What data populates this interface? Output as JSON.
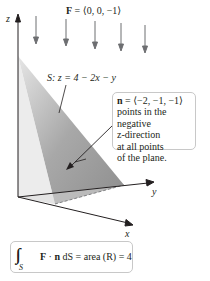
{
  "field": {
    "label_bold": "F",
    "label_rest": " = ⟨0, 0, −1⟩",
    "arrow_color": "#6d6e71",
    "arrow_count": 5
  },
  "axes": {
    "z_label": "z",
    "y_label": "y",
    "x_label": "x",
    "color": "#231f20"
  },
  "surface": {
    "label_prefix": "S",
    "label_eq": ": z = 4 − 2x − y",
    "fill_light": "#d9d9d9",
    "fill_dark": "#9a9a9a"
  },
  "normal_callout": {
    "line1_bold": "n",
    "line1_rest": " = ⟨−2, −1, −1⟩",
    "lines": [
      "points in the",
      "negative",
      "z-direction",
      "at all points",
      "of the plane."
    ]
  },
  "result": {
    "integral_symbol": "∫∫",
    "integral_sub": "S",
    "expr_bold_F": "F",
    "expr_dot": " · ",
    "expr_bold_n": "n",
    "expr_rest": " dS = area (R) = 4"
  }
}
